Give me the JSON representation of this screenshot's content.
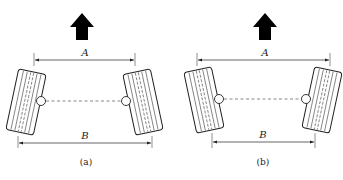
{
  "diagrams": [
    {
      "id": "a",
      "caption": "(a)",
      "dim_top": "A",
      "dim_bottom": "B",
      "description": "toe-in: front distance A smaller than rear distance B"
    },
    {
      "id": "b",
      "caption": "(b)",
      "dim_top": "A",
      "dim_bottom": "B",
      "description": "toe-out: front distance A larger than rear distance B"
    }
  ],
  "colors": {
    "line": "#222222",
    "arrow": "#000000"
  }
}
